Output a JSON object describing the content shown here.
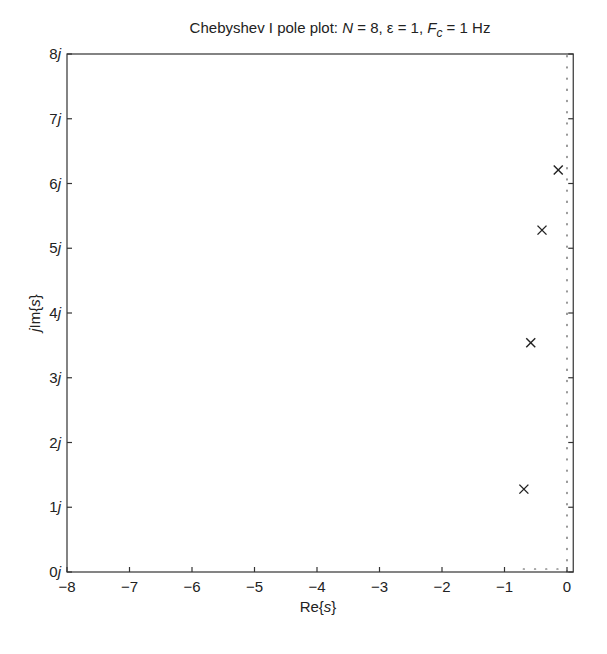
{
  "chart_data": {
    "type": "scatter",
    "title_parts": {
      "prefix": "Chebyshev I pole plot:  ",
      "n_label": "N",
      "n_value": " = 8, ε = 1, ",
      "fc_label": "F",
      "fc_sub": "c",
      "fc_value": " = 1 Hz"
    },
    "xlabel": "Re{s}",
    "ylabel": "jIm{s}",
    "xlim": [
      -8,
      0.1
    ],
    "ylim": [
      0,
      8
    ],
    "x_ticks": [
      -8,
      -7,
      -6,
      -5,
      -4,
      -3,
      -2,
      -1,
      0
    ],
    "x_tick_labels": [
      "−8",
      "−7",
      "−6",
      "−5",
      "−4",
      "−3",
      "−2",
      "−1",
      "0"
    ],
    "y_ticks": [
      0,
      1,
      2,
      3,
      4,
      5,
      6,
      7,
      8
    ],
    "y_tick_labels": [
      "0j",
      "1j",
      "2j",
      "3j",
      "4j",
      "5j",
      "6j",
      "7j",
      "8j"
    ],
    "grid": false,
    "reference_lines": [
      {
        "orientation": "vertical",
        "x": 0,
        "style": "dotted"
      },
      {
        "orientation": "horizontal",
        "y": 0,
        "style": "dotted"
      }
    ],
    "series": [
      {
        "name": "poles",
        "marker": "x",
        "points": [
          {
            "re": -0.14,
            "im": 6.21
          },
          {
            "re": -0.4,
            "im": 5.28
          },
          {
            "re": -0.58,
            "im": 3.54
          },
          {
            "re": -0.69,
            "im": 1.28
          }
        ]
      }
    ]
  }
}
